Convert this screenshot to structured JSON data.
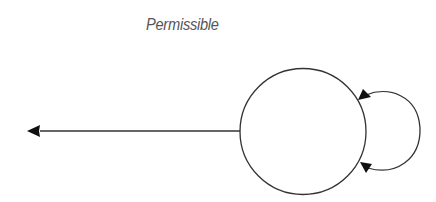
{
  "diagram": {
    "title": "Permissible",
    "nodes": [
      {
        "id": "state",
        "label": ""
      }
    ],
    "edges": [
      {
        "id": "outgoing",
        "from": "state",
        "to": "outside-left",
        "directed": true
      },
      {
        "id": "self-loop",
        "from": "state",
        "to": "state",
        "directed": true,
        "arrowheads": 2
      }
    ],
    "colors": {
      "stroke": "#333333",
      "arrow": "#111111",
      "title": "#555555"
    }
  }
}
